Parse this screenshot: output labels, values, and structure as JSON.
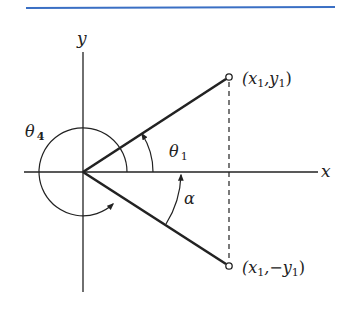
{
  "figure": {
    "header_rule_color": "#3a6fc4",
    "ink_color": "#222222",
    "axes": {
      "x_label": "x",
      "y_label": "y"
    },
    "points": {
      "upper": {
        "prefix": "(x",
        "sub1": "1",
        "mid": ",y",
        "sub2": "1",
        "suffix": ")"
      },
      "lower": {
        "prefix": "(x",
        "sub1": "1",
        "mid": ",−y",
        "sub2": "1",
        "suffix": ")"
      }
    },
    "angles": {
      "theta1": {
        "symbol": "θ",
        "sub": "1"
      },
      "theta4": {
        "symbol": "θ",
        "sub": "4"
      },
      "alpha": {
        "symbol": "α"
      }
    }
  }
}
